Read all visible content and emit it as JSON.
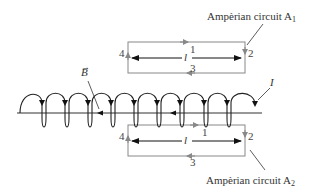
{
  "diagram": {
    "type": "solenoid-amperian-loops",
    "colors": {
      "coil": "#222222",
      "circuit": "#888888",
      "axis": "#333333",
      "text": "#333333"
    },
    "circuit_top": {
      "label_prefix": "Ampèrian circuit A",
      "label_sub": "1",
      "side_labels": {
        "top": "1",
        "right": "2",
        "bottom": "3",
        "left": "4"
      },
      "length_label": "l"
    },
    "circuit_bottom": {
      "label_prefix": "Ampèrian circuit A",
      "label_sub": "2",
      "side_labels": {
        "top": "1",
        "right": "2",
        "bottom": "3",
        "left": "4"
      },
      "length_label": "l"
    },
    "field_label": "B",
    "current_label": "I",
    "coil_turns": 10
  }
}
